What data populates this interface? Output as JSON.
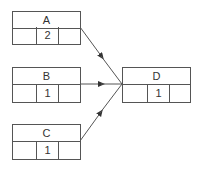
{
  "diagram": {
    "type": "graph",
    "nodes": [
      {
        "id": "A",
        "label": "A",
        "value": "2"
      },
      {
        "id": "B",
        "label": "B",
        "value": "1"
      },
      {
        "id": "C",
        "label": "C",
        "value": "1"
      },
      {
        "id": "D",
        "label": "D",
        "value": "1"
      }
    ],
    "edges": [
      {
        "from": "A",
        "to": "D"
      },
      {
        "from": "B",
        "to": "D"
      },
      {
        "from": "C",
        "to": "D"
      }
    ]
  }
}
